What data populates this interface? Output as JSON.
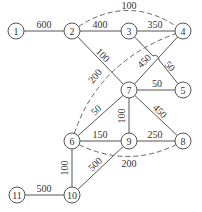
{
  "diagram": {
    "type": "weighted-network-graph",
    "node_radius": 8,
    "colors": {
      "stroke": "#555555",
      "text": "#333333",
      "background": "#ffffff"
    },
    "nodes": [
      {
        "id": "1",
        "label": "1",
        "x": 16,
        "y": 31
      },
      {
        "id": "2",
        "label": "2",
        "x": 72,
        "y": 31
      },
      {
        "id": "3",
        "label": "3",
        "x": 129,
        "y": 31
      },
      {
        "id": "4",
        "label": "4",
        "x": 183,
        "y": 31
      },
      {
        "id": "5",
        "label": "5",
        "x": 183,
        "y": 90
      },
      {
        "id": "6",
        "label": "6",
        "x": 72,
        "y": 141
      },
      {
        "id": "7",
        "label": "7",
        "x": 129,
        "y": 90
      },
      {
        "id": "8",
        "label": "8",
        "x": 183,
        "y": 141
      },
      {
        "id": "9",
        "label": "9",
        "x": 129,
        "y": 141
      },
      {
        "id": "10",
        "label": "10",
        "x": 72,
        "y": 195
      },
      {
        "id": "11",
        "label": "11",
        "x": 17,
        "y": 195
      }
    ],
    "edges": [
      {
        "from": "1",
        "to": "2",
        "weight": "600",
        "style": "solid",
        "label_x": 44,
        "label_y": 24,
        "label_rot": 0
      },
      {
        "from": "2",
        "to": "3",
        "weight": "400",
        "style": "solid",
        "label_x": 100,
        "label_y": 24,
        "label_rot": 0
      },
      {
        "from": "3",
        "to": "4",
        "weight": "350",
        "style": "solid",
        "label_x": 155,
        "label_y": 24,
        "label_rot": 0
      },
      {
        "from": "2",
        "to": "4",
        "weight": "100",
        "style": "dashed",
        "label_x": 129,
        "label_y": 5,
        "label_rot": 0
      },
      {
        "from": "2",
        "to": "7",
        "weight": "100",
        "style": "solid",
        "label_x": 103,
        "label_y": 55,
        "label_rot": 45
      },
      {
        "from": "3",
        "to": "5",
        "weight": "50",
        "style": "solid",
        "label_x": 170,
        "label_y": 66,
        "label_rot": 45
      },
      {
        "from": "7",
        "to": "4",
        "weight": "450",
        "style": "solid",
        "label_x": 144,
        "label_y": 61,
        "label_rot": -45
      },
      {
        "from": "6",
        "to": "4",
        "weight": "200",
        "style": "dashed",
        "label_x": 95,
        "label_y": 76,
        "label_rot": -50
      },
      {
        "from": "7",
        "to": "5",
        "weight": "50",
        "style": "solid",
        "label_x": 157,
        "label_y": 83,
        "label_rot": 0
      },
      {
        "from": "7",
        "to": "6",
        "weight": "50",
        "style": "solid",
        "label_x": 96,
        "label_y": 110,
        "label_rot": -42
      },
      {
        "from": "7",
        "to": "9",
        "weight": "100",
        "style": "solid",
        "label_x": 121,
        "label_y": 116,
        "label_rot": -90
      },
      {
        "from": "7",
        "to": "8",
        "weight": "450",
        "style": "solid",
        "label_x": 160,
        "label_y": 111,
        "label_rot": 45
      },
      {
        "from": "6",
        "to": "9",
        "weight": "150",
        "style": "solid",
        "label_x": 100,
        "label_y": 134,
        "label_rot": 0
      },
      {
        "from": "9",
        "to": "8",
        "weight": "250",
        "style": "solid",
        "label_x": 155,
        "label_y": 134,
        "label_rot": 0
      },
      {
        "from": "6",
        "to": "8",
        "weight": "200",
        "style": "dashed",
        "label_x": 129,
        "label_y": 163,
        "label_rot": 0
      },
      {
        "from": "6",
        "to": "10",
        "weight": "100",
        "style": "solid",
        "label_x": 64,
        "label_y": 168,
        "label_rot": -90
      },
      {
        "from": "9",
        "to": "10",
        "weight": "500",
        "style": "solid",
        "label_x": 95,
        "label_y": 164,
        "label_rot": -45
      },
      {
        "from": "11",
        "to": "10",
        "weight": "500",
        "style": "solid",
        "label_x": 44,
        "label_y": 188,
        "label_rot": 0
      }
    ]
  }
}
